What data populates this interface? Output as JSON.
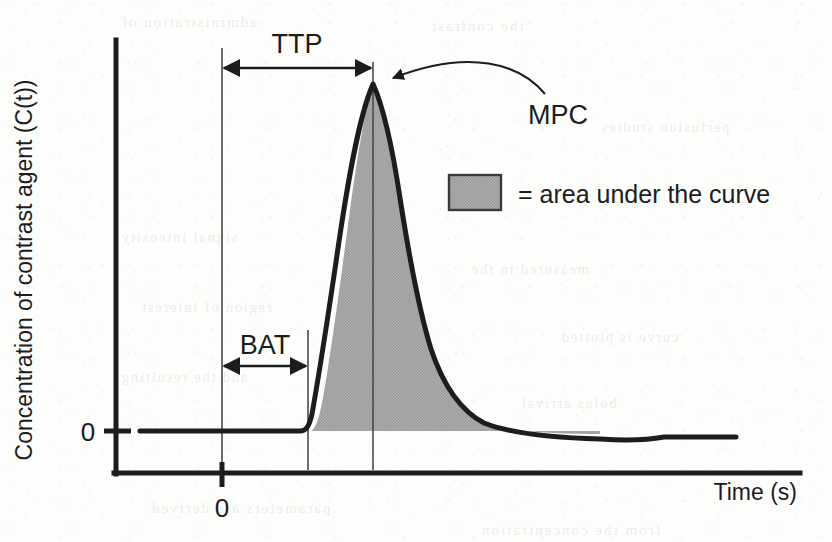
{
  "figure": {
    "axes": {
      "y_label": "Concentration of contrast agent (C(t))",
      "x_label": "Time (s)",
      "y_origin_tick_label": "0",
      "x_origin_tick_label": "0"
    },
    "annotations": {
      "ttp_label": "TTP",
      "bat_label": "BAT",
      "mpc_label": "MPC"
    },
    "legend": {
      "swatch_name": "area-under-curve-swatch",
      "text": "= area under the curve",
      "swatch_color": "#a6a6a6",
      "swatch_border_color": "#3a3a3a"
    },
    "colors": {
      "ink": "#1c1c1c",
      "fill_gray": "#a6a6a6",
      "thin_line": "#4a4a4a",
      "background": "#fdfdfc"
    },
    "bleed_through": [
      {
        "text": "administration of",
        "x": 120,
        "y": 14,
        "size": 15
      },
      {
        "text": "the contrast",
        "x": 430,
        "y": 18,
        "size": 15
      },
      {
        "text": "perfusion studies",
        "x": 600,
        "y": 120,
        "size": 14
      },
      {
        "text": "signal intensity",
        "x": 120,
        "y": 230,
        "size": 14
      },
      {
        "text": "measured in the",
        "x": 470,
        "y": 262,
        "size": 14
      },
      {
        "text": "region of interest",
        "x": 140,
        "y": 300,
        "size": 14
      },
      {
        "text": "curve is plotted",
        "x": 560,
        "y": 330,
        "size": 14
      },
      {
        "text": "and the resulting",
        "x": 120,
        "y": 370,
        "size": 14
      },
      {
        "text": "bolus arrival",
        "x": 520,
        "y": 396,
        "size": 14
      },
      {
        "text": "parameters are derived",
        "x": 150,
        "y": 500,
        "size": 15
      },
      {
        "text": "from the concentration",
        "x": 480,
        "y": 522,
        "size": 15
      }
    ]
  },
  "chart_data": {
    "type": "area",
    "title": "",
    "xlabel": "Time (s)",
    "ylabel": "Concentration of contrast agent (C(t))",
    "xlim": [
      0,
      100
    ],
    "ylim": [
      0,
      1.08
    ],
    "grid": false,
    "legend": [
      "= area under the curve"
    ],
    "legend_position": "inside-right",
    "series": [
      {
        "name": "contrast concentration C(t)",
        "x": [
          0,
          6,
          12,
          18,
          22,
          26,
          28,
          29.5,
          31,
          33,
          35,
          37,
          39,
          41,
          43,
          45,
          47,
          49,
          51,
          54,
          57,
          60,
          64,
          68,
          72,
          76,
          80,
          84,
          88,
          92,
          96,
          100
        ],
        "y": [
          0,
          0,
          0,
          0,
          0,
          0,
          0.01,
          0.06,
          0.22,
          0.52,
          0.78,
          0.94,
          1.0,
          0.96,
          0.86,
          0.72,
          0.58,
          0.46,
          0.36,
          0.25,
          0.18,
          0.13,
          0.08,
          0.05,
          0.03,
          0.01,
          -0.01,
          -0.01,
          0.0,
          0.0,
          0.0,
          0.0
        ]
      }
    ],
    "annotations": [
      {
        "label": "TTP",
        "type": "double-arrow",
        "from_x": 0,
        "to_x": 39,
        "at_y": 1.04,
        "description": "time to peak measured from time zero to the peak concentration"
      },
      {
        "label": "BAT",
        "type": "double-arrow",
        "from_x": 0,
        "to_x": 26,
        "at_y": 0.175,
        "description": "bolus arrival time measured from time zero to the onset of the upslope"
      },
      {
        "label": "MPC",
        "type": "curved-pointer",
        "points_to_x": 39,
        "points_to_y": 1.0,
        "description": "maximum peak concentration at the apex of the curve"
      }
    ],
    "reference_lines": [
      {
        "name": "time-zero",
        "x": 0,
        "style": "thin-vertical"
      },
      {
        "name": "bolus-arrival",
        "x": 26,
        "style": "thin-vertical"
      },
      {
        "name": "time-to-peak",
        "x": 39,
        "style": "thin-vertical"
      }
    ],
    "shaded_region": {
      "name": "area under the curve",
      "color": "#a6a6a6",
      "from_x": 26,
      "to_x": 100
    }
  }
}
